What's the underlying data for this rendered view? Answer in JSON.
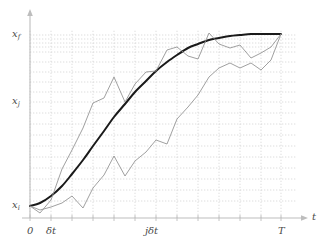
{
  "figure": {
    "title": "",
    "axes": {
      "x_axis_label": "t",
      "y_axis_label": "",
      "x_ticks": [
        {
          "label": "0",
          "sub": "",
          "x": 30
        },
        {
          "label": "δt",
          "sub": "",
          "x": 51
        },
        {
          "label": "jδt",
          "sub": "",
          "x": 152
        },
        {
          "label": "T",
          "sub": "",
          "x": 281
        }
      ],
      "y_ticks": [
        {
          "base": "x",
          "sub": "f",
          "y": 35
        },
        {
          "base": "x",
          "sub": "j",
          "y": 102
        },
        {
          "base": "x",
          "sub": "i",
          "y": 206
        }
      ]
    },
    "colors": {
      "classical_path": "#1a1a1a",
      "sample_path": "#8f8f8f",
      "gridline": "#cfcfcf",
      "axis": "#bdbdbd",
      "label": "#4a4a4a"
    }
  },
  "chart_data": {
    "type": "line",
    "title": "",
    "xlabel": "t",
    "ylabel": "x",
    "grid": true,
    "legend": "none",
    "xlim": [
      0,
      1
    ],
    "ylim": [
      0,
      1
    ],
    "x_tick_labels": [
      "0",
      "δt",
      "jδt",
      "T"
    ],
    "y_tick_labels": [
      "x_i",
      "x_j",
      "x_f"
    ],
    "time_slices": [
      30,
      51,
      72,
      93,
      114,
      135,
      156,
      177,
      198,
      219,
      240,
      261,
      281
    ],
    "horizontal_gridlines": [
      35,
      39,
      43,
      47,
      52,
      62,
      72,
      82,
      92,
      102,
      113,
      124,
      135,
      146,
      157,
      168,
      179,
      190,
      201
    ],
    "series": [
      {
        "name": "classical-path",
        "style": "smooth-thick-black",
        "points": [
          [
            30,
            206
          ],
          [
            40,
            203
          ],
          [
            51,
            196
          ],
          [
            62,
            186
          ],
          [
            72,
            174
          ],
          [
            83,
            160
          ],
          [
            93,
            146
          ],
          [
            104,
            131
          ],
          [
            114,
            117
          ],
          [
            125,
            104
          ],
          [
            135,
            92
          ],
          [
            146,
            81
          ],
          [
            156,
            71
          ],
          [
            167,
            62
          ],
          [
            177,
            55
          ],
          [
            188,
            48
          ],
          [
            198,
            44
          ],
          [
            209,
            40
          ],
          [
            219,
            38
          ],
          [
            230,
            36
          ],
          [
            240,
            35
          ],
          [
            251,
            34
          ],
          [
            261,
            34
          ],
          [
            271,
            34
          ],
          [
            281,
            34
          ]
        ]
      },
      {
        "name": "sample-path-upper",
        "style": "zigzag-gray",
        "points": [
          [
            30,
            206
          ],
          [
            40,
            213
          ],
          [
            51,
            200
          ],
          [
            62,
            169
          ],
          [
            72,
            150
          ],
          [
            83,
            128
          ],
          [
            93,
            103
          ],
          [
            104,
            98
          ],
          [
            114,
            77
          ],
          [
            125,
            102
          ],
          [
            135,
            84
          ],
          [
            146,
            72
          ],
          [
            156,
            71
          ],
          [
            167,
            50
          ],
          [
            177,
            47
          ],
          [
            188,
            56
          ],
          [
            198,
            59
          ],
          [
            209,
            33
          ],
          [
            219,
            44
          ],
          [
            230,
            48
          ],
          [
            240,
            45
          ],
          [
            251,
            58
          ],
          [
            261,
            53
          ],
          [
            271,
            47
          ],
          [
            281,
            34
          ]
        ]
      },
      {
        "name": "sample-path-lower",
        "style": "zigzag-gray",
        "points": [
          [
            30,
            206
          ],
          [
            40,
            210
          ],
          [
            51,
            207
          ],
          [
            62,
            203
          ],
          [
            72,
            196
          ],
          [
            83,
            208
          ],
          [
            93,
            188
          ],
          [
            104,
            175
          ],
          [
            114,
            156
          ],
          [
            125,
            176
          ],
          [
            135,
            161
          ],
          [
            146,
            152
          ],
          [
            156,
            140
          ],
          [
            167,
            144
          ],
          [
            177,
            119
          ],
          [
            188,
            107
          ],
          [
            198,
            95
          ],
          [
            209,
            77
          ],
          [
            219,
            68
          ],
          [
            230,
            63
          ],
          [
            240,
            68
          ],
          [
            251,
            63
          ],
          [
            261,
            70
          ],
          [
            271,
            60
          ],
          [
            281,
            34
          ]
        ]
      }
    ]
  }
}
